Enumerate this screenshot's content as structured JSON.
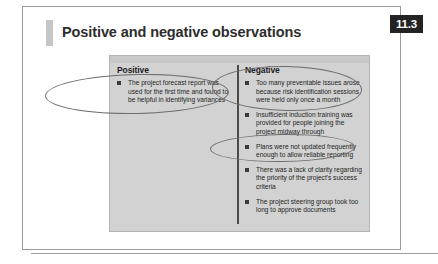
{
  "page": {
    "title": "Positive and negative observations",
    "section_badge": "11.3",
    "badge_bg": "#232323",
    "badge_text_color": "#ffffff",
    "panel_bg": "#d2d2d2",
    "annotation_color": "#6e6e6e"
  },
  "panel": {
    "columns": [
      {
        "id": "positive",
        "header": "Positive",
        "items": [
          "The project forecast report was used for the first time and found to be helpful in identifying variances"
        ]
      },
      {
        "id": "negative",
        "header": "Negative",
        "items": [
          "Too many preventable issues arose because risk identification sessions were held only once a month",
          "Insufficient induction training was provided for people joining the project midway through",
          "Plans were not updated frequently enough to allow reliable reporting",
          "There was a lack of clarity regarding the priority of the project's success criteria",
          "The project steering group took too long to approve documents"
        ]
      }
    ]
  },
  "annotations": [
    {
      "name": "ellipse-positive-item-1",
      "target": "positive item 1"
    },
    {
      "name": "ellipse-negative-item-1",
      "target": "negative item 1"
    },
    {
      "name": "ellipse-negative-item-3",
      "target": "negative item 3"
    }
  ]
}
